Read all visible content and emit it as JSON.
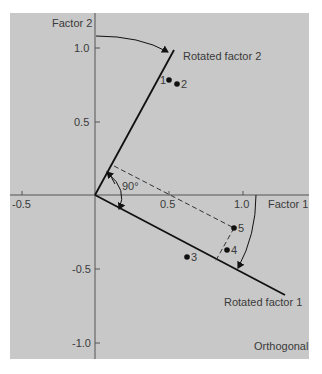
{
  "diagram": {
    "x_axis_label": "Factor 1",
    "y_axis_label": "Factor 2",
    "x_ticks": [
      "-0.5",
      "0.5",
      "1.0"
    ],
    "y_ticks": [
      "1.0",
      "0.5",
      "-0.5",
      "-1.0"
    ],
    "rotated_axis_1_label": "Rotated factor 1",
    "rotated_axis_2_label": "Rotated factor 2",
    "angle_label": "90°",
    "rotation_type": "Orthogonal",
    "points": [
      {
        "label": "1",
        "x": 0.5,
        "y": 0.78
      },
      {
        "label": "2",
        "x": 0.56,
        "y": 0.76
      },
      {
        "label": "3",
        "x": 0.63,
        "y": -0.42
      },
      {
        "label": "4",
        "x": 0.9,
        "y": -0.37
      },
      {
        "label": "5",
        "x": 0.95,
        "y": -0.22
      }
    ],
    "colors": {
      "background": "#c8c8c8",
      "axis": "#555555",
      "rotated_axis": "#111111",
      "text": "#3a3a3a"
    }
  }
}
